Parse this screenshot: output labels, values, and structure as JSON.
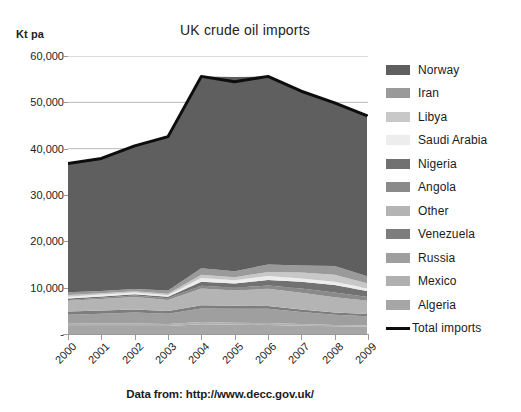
{
  "chart_data": {
    "type": "area",
    "title": "UK crude oil imports",
    "subtitle": "",
    "ylabel": "Kt pa",
    "xlabel": "",
    "caption": "Data from: http://www.decc.gov.uk/",
    "grid": true,
    "stacked": true,
    "legend_position": "right",
    "ylim": [
      0,
      60000
    ],
    "categories": [
      "2000",
      "2001",
      "2002",
      "2003",
      "2004",
      "2005",
      "2006",
      "2007",
      "2008",
      "2009"
    ],
    "ytick_labels": [
      "60,000",
      "50,000",
      "40,000",
      "30,000",
      "20,000",
      "10,000",
      "-"
    ],
    "ytick_values": [
      60000,
      50000,
      40000,
      30000,
      20000,
      10000,
      0
    ],
    "series": [
      {
        "name": "Norway",
        "color": "#5f5f5f",
        "values": [
          27800,
          28600,
          30900,
          33200,
          41400,
          41900,
          40600,
          37600,
          35200,
          34600
        ]
      },
      {
        "name": "Iran",
        "color": "#9a9a9a",
        "values": [
          600,
          500,
          450,
          700,
          1400,
          1300,
          1600,
          1500,
          1900,
          1500
        ]
      },
      {
        "name": "Libya",
        "color": "#c8c8c8",
        "values": [
          350,
          300,
          300,
          350,
          700,
          650,
          900,
          1300,
          1500,
          1100
        ]
      },
      {
        "name": "Saudi Arabia",
        "color": "#ededed",
        "values": [
          400,
          380,
          350,
          300,
          800,
          700,
          850,
          700,
          750,
          600
        ]
      },
      {
        "name": "Nigeria",
        "color": "#717171",
        "values": [
          300,
          300,
          300,
          350,
          900,
          900,
          1200,
          1500,
          1600,
          1200
        ]
      },
      {
        "name": "Angola",
        "color": "#8a8a8a",
        "values": [
          200,
          250,
          300,
          350,
          600,
          600,
          700,
          900,
          1000,
          800
        ]
      },
      {
        "name": "Other",
        "color": "#b4b4b4",
        "values": [
          2300,
          2500,
          2700,
          2400,
          3600,
          3300,
          3700,
          3600,
          3300,
          2900
        ]
      },
      {
        "name": "Venezuela",
        "color": "#7d7d7d",
        "values": [
          700,
          700,
          650,
          600,
          700,
          650,
          600,
          550,
          500,
          450
        ]
      },
      {
        "name": "Russia",
        "color": "#9f9f9f",
        "values": [
          1800,
          2100,
          2400,
          2200,
          2900,
          3000,
          3100,
          2600,
          2200,
          2000
        ]
      },
      {
        "name": "Mexico",
        "color": "#b0b0b0",
        "values": [
          600,
          550,
          500,
          450,
          500,
          450,
          400,
          350,
          300,
          250
        ]
      },
      {
        "name": "Algeria",
        "color": "#a6a6a6",
        "values": [
          1750,
          1720,
          1750,
          1700,
          2100,
          2000,
          1950,
          1800,
          1650,
          1600
        ]
      }
    ],
    "total_line": {
      "name": "Total imports",
      "color": "#0d0d0d",
      "values": [
        36800,
        37900,
        40600,
        42600,
        55600,
        54450,
        55600,
        52400,
        49900,
        47000
      ]
    }
  },
  "legend": {
    "items": [
      {
        "label": "Norway",
        "swatch": "#5f5f5f",
        "kind": "area"
      },
      {
        "label": "Iran",
        "swatch": "#9a9a9a",
        "kind": "area"
      },
      {
        "label": "Libya",
        "swatch": "#c8c8c8",
        "kind": "area"
      },
      {
        "label": "Saudi Arabia",
        "swatch": "#ededed",
        "kind": "area"
      },
      {
        "label": "Nigeria",
        "swatch": "#717171",
        "kind": "area"
      },
      {
        "label": "Angola",
        "swatch": "#8a8a8a",
        "kind": "area"
      },
      {
        "label": "Other",
        "swatch": "#b4b4b4",
        "kind": "area"
      },
      {
        "label": "Venezuela",
        "swatch": "#7d7d7d",
        "kind": "area"
      },
      {
        "label": "Russia",
        "swatch": "#9f9f9f",
        "kind": "area"
      },
      {
        "label": "Mexico",
        "swatch": "#b0b0b0",
        "kind": "area"
      },
      {
        "label": "Algeria",
        "swatch": "#a6a6a6",
        "kind": "area"
      },
      {
        "label": "Total imports",
        "swatch": "#0d0d0d",
        "kind": "line"
      }
    ]
  }
}
